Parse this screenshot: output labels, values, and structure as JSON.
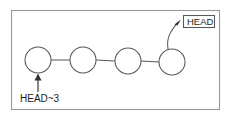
{
  "figure": {
    "background_color": "#ffffff",
    "border_color": "#9a9a9a",
    "stroke_color": "#585858",
    "text_color": "#1d1d1d",
    "width": 231,
    "height": 118
  },
  "diagram": {
    "type": "commit-chain",
    "node_count": 4,
    "node_radius": 13,
    "nodes": [
      {
        "id": "commit-1",
        "cx": 38,
        "cy": 60,
        "label": ""
      },
      {
        "id": "commit-2",
        "cx": 83,
        "cy": 60,
        "label": ""
      },
      {
        "id": "commit-3",
        "cx": 128,
        "cy": 61,
        "label": ""
      },
      {
        "id": "commit-4",
        "cx": 172,
        "cy": 62,
        "label": ""
      }
    ],
    "links": [
      {
        "from": "commit-1",
        "to": "commit-2"
      },
      {
        "from": "commit-2",
        "to": "commit-3"
      },
      {
        "from": "commit-3",
        "to": "commit-4"
      }
    ]
  },
  "labels": {
    "head": {
      "text": "HEAD",
      "target": "commit-4",
      "boxed": true
    },
    "head_ancestor": {
      "text": "HEAD~3",
      "target": "commit-1",
      "boxed": false
    }
  }
}
